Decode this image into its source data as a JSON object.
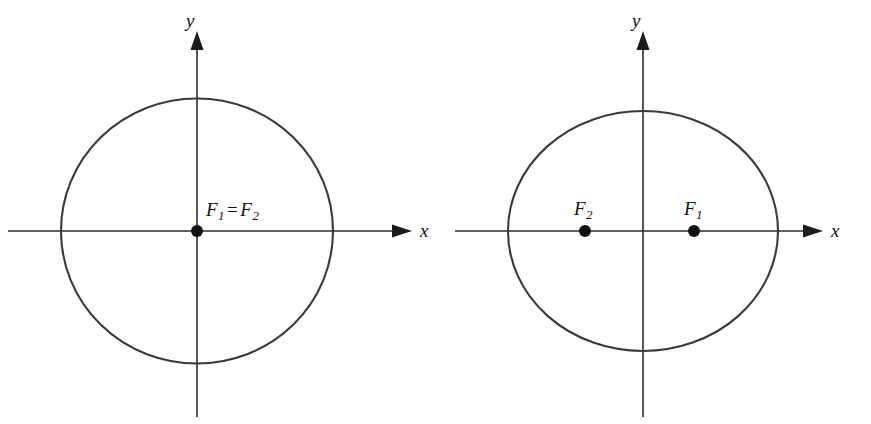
{
  "figure": {
    "background_color": "#ffffff",
    "stroke_color": "#3a3a3a",
    "axis_color": "#2b2b2b",
    "dot_color": "#111111",
    "panels": [
      {
        "id": "left-panel",
        "shape": "circle",
        "description": "Circle centered at origin with coincident foci at the center",
        "center": {
          "x": 197,
          "y": 231
        },
        "radius_x": 136,
        "radius_y": 132,
        "x_axis_label": "x",
        "y_axis_label": "y",
        "foci_label": {
          "f1": "F",
          "f1_sub": "1",
          "equals": "=",
          "f2": "F",
          "f2_sub": "2"
        },
        "foci_points": [
          {
            "name": "F1=F2",
            "x": 197,
            "y": 231
          }
        ]
      },
      {
        "id": "right-panel",
        "shape": "ellipse",
        "description": "Ellipse centered at origin with two distinct foci on the x-axis",
        "center": {
          "x": 643,
          "y": 231
        },
        "radius_x": 135,
        "radius_y": 120,
        "x_axis_label": "x",
        "y_axis_label": "y",
        "foci_points": [
          {
            "name": "F2",
            "letter": "F",
            "sub": "2",
            "x": 585,
            "y": 231
          },
          {
            "name": "F1",
            "letter": "F",
            "sub": "1",
            "x": 694,
            "y": 231
          }
        ]
      }
    ]
  }
}
